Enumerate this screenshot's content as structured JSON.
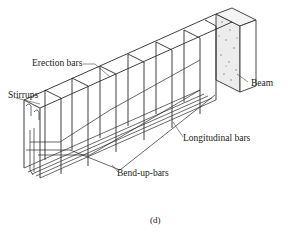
{
  "figure": {
    "caption": "(d)",
    "labels": {
      "erection_bars": "Erection bars",
      "stirrups": "Stirrups",
      "beam": "Beam",
      "longitudinal_bars": "Longitudinal bars",
      "bend_up_bars": "Bend-up-bars"
    },
    "colors": {
      "line": "#2a2a2a",
      "beam_fill": "#e8e8e8",
      "background": "#ffffff"
    }
  }
}
